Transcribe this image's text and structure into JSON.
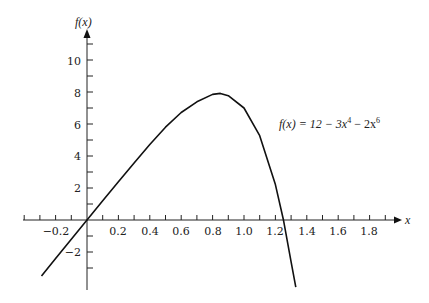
{
  "chart_data": {
    "type": "line",
    "title": "",
    "xlabel": "x",
    "ylabel": "f(x)",
    "annotation": {
      "text_prefix": "f(x) = 12 − 3x",
      "exp1": "4",
      "mid": " − 2x",
      "exp2": "6"
    },
    "xlim": [
      -0.3,
      1.9
    ],
    "ylim": [
      -3.5,
      11.5
    ],
    "grid": false,
    "x_ticks": [
      "−0.2",
      "0.2",
      "0.4",
      "0.6",
      "0.8",
      "1.0",
      "1.2",
      "1.4",
      "1.6",
      "1.8"
    ],
    "y_ticks": [
      "10",
      "8",
      "6",
      "4",
      "2",
      "−2"
    ],
    "series": [
      {
        "name": "f(x)",
        "x": [
          -0.29,
          -0.2,
          -0.1,
          0,
          0.1,
          0.2,
          0.3,
          0.4,
          0.5,
          0.6,
          0.7,
          0.8,
          0.85,
          0.9,
          1.0,
          1.1,
          1.2,
          1.25,
          1.3,
          1.33
        ],
        "y": [
          -3.5,
          -2.4,
          -1.2,
          0,
          1.2,
          2.39,
          3.57,
          4.72,
          5.8,
          6.72,
          7.39,
          7.85,
          7.91,
          7.77,
          7.0,
          5.27,
          2.21,
          0.05,
          -2.62,
          -4.2
        ]
      }
    ]
  }
}
